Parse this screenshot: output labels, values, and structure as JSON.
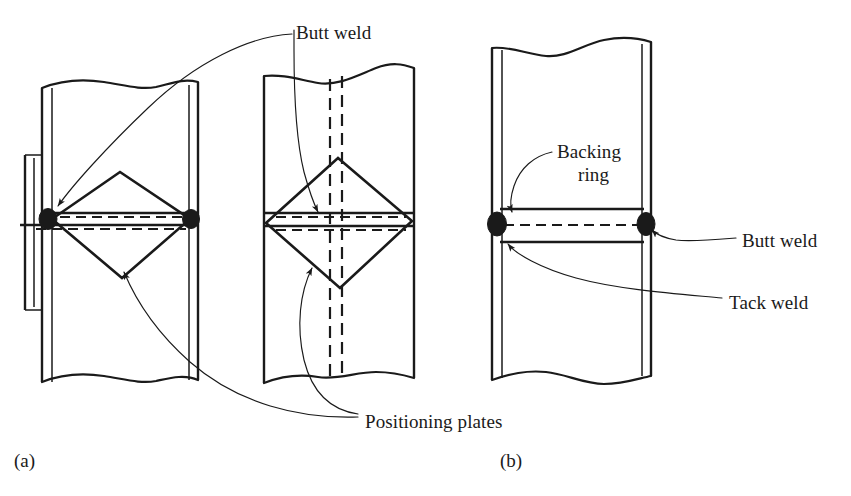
{
  "figure": {
    "caption_tags": [
      {
        "id": "a",
        "text": "(a)",
        "x": 14,
        "y": 450
      },
      {
        "id": "b",
        "text": "(b)",
        "x": 500,
        "y": 450
      }
    ],
    "labels": [
      {
        "id": "butt-weld-top",
        "text": "Butt weld",
        "x": 296,
        "y": 22
      },
      {
        "id": "positioning-plates",
        "text": "Positioning plates",
        "x": 365,
        "y": 411
      },
      {
        "id": "backing-ring-line1",
        "text": "Backing",
        "x": 557,
        "y": 141
      },
      {
        "id": "backing-ring-line2",
        "text": "ring",
        "x": 578,
        "y": 164
      },
      {
        "id": "butt-weld-right",
        "text": "Butt weld",
        "x": 742,
        "y": 230
      },
      {
        "id": "tack-weld-right",
        "text": "Tack weld",
        "x": 729,
        "y": 292
      }
    ],
    "parts": {
      "pipe_a": {
        "name": "pipe-wall-section-a"
      },
      "pipe_mid": {
        "name": "pipe-wall-section-a-front-view"
      },
      "pipe_b": {
        "name": "pipe-wall-section-b"
      },
      "diamond_a": {
        "name": "positioning-plate-diamond-a"
      },
      "diamond_mid": {
        "name": "positioning-plate-diamond-front"
      },
      "backing_ring": {
        "name": "backing-ring-band"
      },
      "weld_beads": {
        "name": "weld-bead"
      }
    },
    "colors": {
      "ink": "#1a1a1a",
      "background": "#ffffff"
    }
  }
}
